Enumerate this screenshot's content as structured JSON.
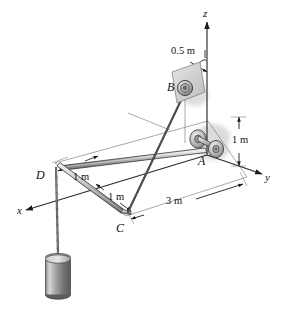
{
  "figure": {
    "type": "engineering-statics-diagram",
    "colors": {
      "line": "#1a1a1a",
      "rod_light": "#e8e8e8",
      "rod_mid": "#b9b9b9",
      "rod_dark": "#8a8a8a",
      "plate": "#d4d4d4",
      "cylinder_light": "#cfcfcf",
      "cylinder_dark": "#6b6b6b",
      "cord": "#3a3a3a",
      "thin": "#555555",
      "background": "#ffffff"
    }
  },
  "axes": {
    "z_label": "z",
    "y_label": "y",
    "x_label": "x"
  },
  "points": {
    "A": "A",
    "B": "B",
    "C": "C",
    "D": "D"
  },
  "dimensions": [
    {
      "id": "offset-b",
      "text": "0.5 m",
      "orientation": "horizontal"
    },
    {
      "id": "height-a",
      "text": "1 m",
      "orientation": "vertical"
    },
    {
      "id": "length-dc-x",
      "text": "1 m",
      "orientation": "oblique"
    },
    {
      "id": "length-cd-y",
      "text": "1 m",
      "orientation": "oblique"
    },
    {
      "id": "length-ac",
      "text": "3 m",
      "orientation": "oblique"
    }
  ],
  "labels": {
    "dim_0_5m": "0.5 m",
    "dim_1m_height": "1 m",
    "dim_1m_first": "1 m",
    "dim_1m_second": "1 m",
    "dim_3m": "3 m"
  },
  "components": [
    {
      "name": "pulley-b",
      "label": "B",
      "kind": "pulley-on-wall-plate"
    },
    {
      "name": "bearing-a",
      "label": "A",
      "kind": "journal-bearing-with-collar"
    },
    {
      "name": "rod-ad",
      "label": "",
      "kind": "straight-rod"
    },
    {
      "name": "rod-dc",
      "label": "",
      "kind": "bent-rod-segment"
    },
    {
      "name": "cord-bc",
      "label": "",
      "kind": "cable"
    },
    {
      "name": "cord-d",
      "label": "",
      "kind": "hanging-cable"
    },
    {
      "name": "cylinder",
      "label": "",
      "kind": "suspended-weight"
    }
  ]
}
